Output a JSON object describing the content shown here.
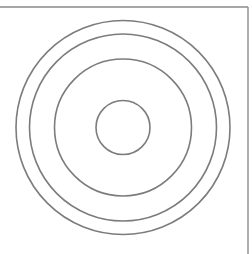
{
  "diagram": {
    "type": "concentric-circles",
    "canvas": {
      "width": 252,
      "height": 254,
      "background": "#ffffff"
    },
    "stroke_color": "#7c7c7c",
    "stroke_width": 1.6,
    "center": {
      "x": 123,
      "y": 127.5
    },
    "circles": [
      {
        "id": "ring-inner",
        "r": 27
      },
      {
        "id": "ring-middle",
        "r": 68.5
      },
      {
        "id": "ring-outer-2",
        "r": 93.5
      },
      {
        "id": "ring-outer-1",
        "r": 107
      }
    ],
    "frame": {
      "top_line": {
        "x1": 0,
        "y1": 7,
        "x2": 248,
        "y2": 7
      },
      "right_line": {
        "x1": 248,
        "y1": 7,
        "x2": 248,
        "y2": 254
      },
      "color": "#8a8a8a",
      "width": 1.4
    }
  }
}
